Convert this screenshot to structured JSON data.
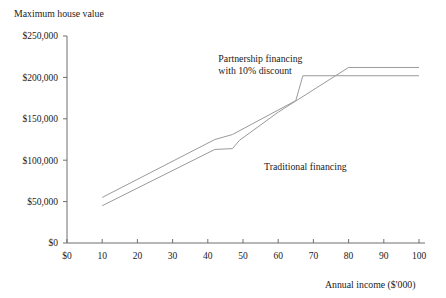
{
  "chart_data": {
    "type": "line",
    "title": "",
    "ylabel": "Maximum house value",
    "xlabel": "Annual income ($'000)",
    "xlim": [
      0,
      100
    ],
    "ylim": [
      0,
      250000
    ],
    "grid": false,
    "legend": "inline-annotations",
    "x_tick_labels": [
      "$0",
      "10",
      "20",
      "30",
      "40",
      "50",
      "60",
      "70",
      "80",
      "90",
      "100"
    ],
    "x_ticks": [
      0,
      10,
      20,
      30,
      40,
      50,
      60,
      70,
      80,
      90,
      100
    ],
    "y_tick_labels": [
      "$0",
      "$50,000",
      "$100,000",
      "$150,000",
      "$200,000",
      "$250,000"
    ],
    "y_ticks": [
      0,
      50000,
      100000,
      150000,
      200000,
      250000
    ],
    "series": [
      {
        "name": "Partnership financing with 10% discount",
        "color": "#9a9a9a",
        "points": [
          [
            10,
            55000
          ],
          [
            42,
            125000
          ],
          [
            47,
            131000
          ],
          [
            65,
            172000
          ],
          [
            67,
            202000
          ],
          [
            100,
            202000
          ]
        ]
      },
      {
        "name": "Traditional financing",
        "color": "#9a9a9a",
        "points": [
          [
            10,
            45000
          ],
          [
            42,
            113000
          ],
          [
            47,
            114000
          ],
          [
            49,
            124000
          ],
          [
            60,
            158000
          ],
          [
            80,
            212000
          ],
          [
            100,
            212000
          ]
        ]
      }
    ],
    "annotations": [
      {
        "name": "partnership-label",
        "lines": [
          "Partnership financing",
          "with 10% discount"
        ],
        "x": 43,
        "y": 218000
      },
      {
        "name": "traditional-label",
        "lines": [
          "Traditional financing"
        ],
        "x": 56,
        "y": 88000
      }
    ]
  },
  "axis_titles": {
    "y": "Maximum house value",
    "x": "Annual income ($'000)"
  }
}
